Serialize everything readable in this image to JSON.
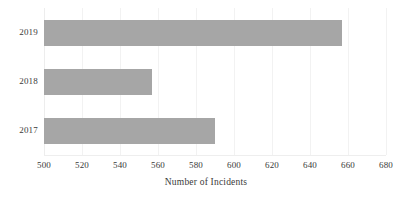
{
  "chart_data": {
    "type": "bar",
    "orientation": "horizontal",
    "title": "",
    "xlabel": "Number of Incidents",
    "ylabel": "",
    "categories": [
      "2019",
      "2018",
      "2017"
    ],
    "values": [
      657,
      557,
      590
    ],
    "series": [
      {
        "name": "Number of Incidents",
        "values": [
          657,
          557,
          590
        ]
      }
    ],
    "xlim": [
      500,
      680
    ],
    "xticks": [
      500,
      520,
      540,
      560,
      580,
      600,
      620,
      640,
      660,
      680
    ],
    "xtick_labels": [
      "500",
      "520",
      "540",
      "560",
      "580",
      "600",
      "620",
      "640",
      "660",
      "680"
    ],
    "grid": true,
    "grid_axis": "x",
    "legend": false,
    "legend_position": "none",
    "bar_color": "#a6a6a6",
    "grid_color": "#f2f2f2",
    "text_color": "#3a3a3a",
    "background_color": "#ffffff"
  }
}
